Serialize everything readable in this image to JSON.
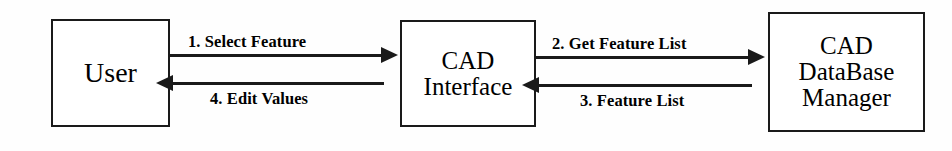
{
  "diagram": {
    "type": "sequence-flow",
    "background_color": "#fefefe",
    "stroke_color": "#1a1a1a",
    "nodes": [
      {
        "id": "user",
        "lines": [
          "User"
        ]
      },
      {
        "id": "cad-interface",
        "lines": [
          "CAD",
          "Interface"
        ]
      },
      {
        "id": "cad-db-manager",
        "lines": [
          "CAD",
          "DataBase",
          "Manager"
        ]
      }
    ],
    "edges": [
      {
        "id": "select-feature",
        "label": "1. Select Feature",
        "from": "user",
        "to": "cad-interface",
        "direction": "right"
      },
      {
        "id": "get-feature-list",
        "label": "2. Get Feature List",
        "from": "cad-interface",
        "to": "cad-db-manager",
        "direction": "right"
      },
      {
        "id": "feature-list",
        "label": "3. Feature List",
        "from": "cad-db-manager",
        "to": "cad-interface",
        "direction": "left"
      },
      {
        "id": "edit-values",
        "label": "4. Edit Values",
        "from": "cad-interface",
        "to": "user",
        "direction": "left"
      }
    ]
  }
}
